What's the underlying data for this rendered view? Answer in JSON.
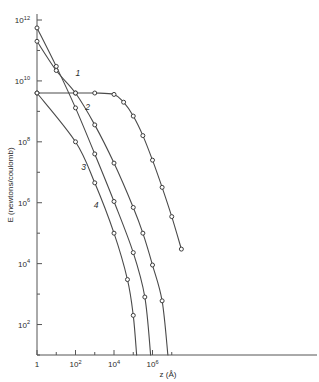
{
  "chart_data": {
    "type": "line",
    "title": "",
    "xlabel": "z (Å)",
    "ylabel": "E (newtons/coulomb)",
    "xscale": "log",
    "yscale": "log",
    "xlim": [
      1,
      31600000.0
    ],
    "ylim": [
      10,
      10000000000000.0
    ],
    "grid": false,
    "legend": "inline-curve-labels",
    "xticks": [
      "1",
      "10",
      "10",
      "10"
    ],
    "xtick_values": [
      1,
      100,
      10000,
      1000000
    ],
    "xtick_exponents": [
      "",
      "2",
      "4",
      "6"
    ],
    "ytick_values": [
      100,
      10000,
      1000000,
      100000000,
      10000000000,
      1000000000000
    ],
    "ytick_labels": [
      "10",
      "10",
      "10",
      "10",
      "10",
      "10"
    ],
    "ytick_exponents": [
      "2",
      "4",
      "6",
      "8",
      "10",
      "12"
    ],
    "series": [
      {
        "name": "1",
        "label": "1",
        "label_x": 100,
        "label_y": 14000000000.0,
        "marker": "circle",
        "x": [
          1,
          100,
          1000,
          10000,
          31600,
          100000,
          316000,
          1000000,
          3160000,
          10000000,
          31600000
        ],
        "y": [
          4000000000.0,
          4000000000.0,
          4000000000.0,
          3600000000.0,
          2000000000.0,
          700000000.0,
          160000000.0,
          25000000.0,
          3200000.0,
          350000.0,
          30000.0
        ]
      },
      {
        "name": "2",
        "label": "2",
        "label_x": 320,
        "label_y": 1100000000.0,
        "marker": "circle",
        "x": [
          1,
          10,
          100,
          1000,
          10000,
          100000,
          316000,
          1000000,
          3160000,
          6300000
        ],
        "y": [
          200000000000.0,
          22000000000.0,
          4000000000.0,
          360000000.0,
          20000000.0,
          700000.0,
          100000.0,
          9000.0,
          600.0,
          10.0
        ]
      },
      {
        "name": "3",
        "label": "3",
        "label_x": 200,
        "label_y": 12000000.0,
        "marker": "circle",
        "x": [
          1,
          10,
          100,
          1000,
          10000,
          100000,
          400000,
          800000
        ],
        "y": [
          550000000000.0,
          30000000000.0,
          1300000000.0,
          40000000.0,
          1100000.0,
          23000.0,
          800.0,
          10.0
        ]
      },
      {
        "name": "4",
        "label": "4",
        "label_x": 900,
        "label_y": 650000.0,
        "marker": "circle",
        "x": [
          1,
          100,
          1000,
          10000,
          50000,
          100000,
          150000
        ],
        "y": [
          4000000000.0,
          100000000.0,
          4500000.0,
          100000.0,
          3000.0,
          200.0,
          10.0
        ]
      }
    ]
  },
  "axes": {
    "x_title": "z (Å)",
    "y_title": "E (newtons/coulomb)"
  }
}
